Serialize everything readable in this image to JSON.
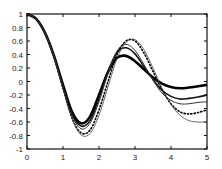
{
  "chart_data": {
    "type": "line",
    "title": "",
    "xlabel": "",
    "ylabel": "",
    "xlim": [
      0,
      5
    ],
    "ylim": [
      -1,
      1
    ],
    "grid": false,
    "legend": null,
    "xticks": [
      "0",
      "1",
      "2",
      "3",
      "4",
      "5"
    ],
    "yticks": [
      "1",
      "0.8",
      "0.6",
      "0.4",
      "0.2",
      "0",
      "-0.2",
      "-0.4",
      "-0.6",
      "-0.8",
      "-1"
    ],
    "x": [
      0,
      0.25,
      0.5,
      0.75,
      1.0,
      1.25,
      1.5,
      1.75,
      2.0,
      2.25,
      2.5,
      2.75,
      3.0,
      3.25,
      3.5,
      3.75,
      4.0,
      4.25,
      4.5,
      4.75,
      5.0
    ],
    "series": [
      {
        "name": "curve-1 (thick solid)",
        "style": "thick",
        "values": [
          1.0,
          0.93,
          0.72,
          0.38,
          -0.05,
          -0.45,
          -0.62,
          -0.52,
          -0.2,
          0.14,
          0.35,
          0.38,
          0.3,
          0.18,
          0.06,
          -0.03,
          -0.08,
          -0.1,
          -0.09,
          -0.07,
          -0.05
        ]
      },
      {
        "name": "curve-2 (medium solid)",
        "style": "medium",
        "values": [
          1.0,
          0.93,
          0.72,
          0.37,
          -0.07,
          -0.48,
          -0.66,
          -0.58,
          -0.25,
          0.15,
          0.43,
          0.5,
          0.41,
          0.22,
          0.03,
          -0.13,
          -0.22,
          -0.26,
          -0.25,
          -0.23,
          -0.2
        ]
      },
      {
        "name": "curve-3 (thin solid)",
        "style": "thin",
        "values": [
          1.0,
          0.93,
          0.72,
          0.37,
          -0.08,
          -0.5,
          -0.7,
          -0.62,
          -0.3,
          0.12,
          0.45,
          0.55,
          0.46,
          0.25,
          0.02,
          -0.17,
          -0.28,
          -0.33,
          -0.33,
          -0.31,
          -0.3
        ]
      },
      {
        "name": "curve-4 (dotted)",
        "style": "dotted",
        "values": [
          1.0,
          0.93,
          0.72,
          0.36,
          -0.1,
          -0.54,
          -0.76,
          -0.72,
          -0.42,
          0.0,
          0.4,
          0.6,
          0.6,
          0.42,
          0.15,
          -0.12,
          -0.33,
          -0.45,
          -0.48,
          -0.46,
          -0.42
        ]
      },
      {
        "name": "curve-5 (thin long)",
        "style": "hairline",
        "values": [
          1.0,
          0.93,
          0.72,
          0.36,
          -0.11,
          -0.55,
          -0.79,
          -0.77,
          -0.5,
          -0.08,
          0.34,
          0.58,
          0.62,
          0.47,
          0.2,
          -0.1,
          -0.34,
          -0.5,
          -0.58,
          -0.6,
          -0.6
        ]
      }
    ]
  }
}
